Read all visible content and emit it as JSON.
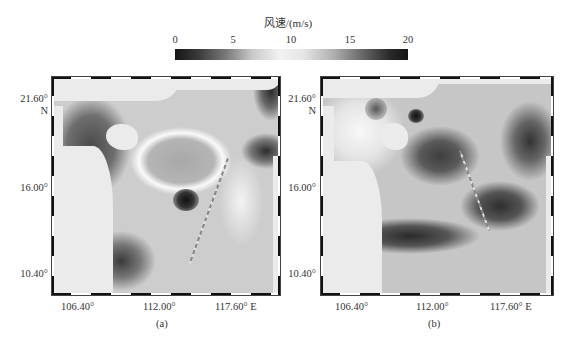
{
  "colorbar": {
    "title": "风速/(m/s)",
    "ticks": [
      "0",
      "5",
      "10",
      "15",
      "20"
    ],
    "min": 0,
    "max": 20,
    "colormap": "grayscale diverging: dark at 0 and 20, white at ~10"
  },
  "axes": {
    "y_ticks": [
      "21.60°",
      "16.00°",
      "10.40°"
    ],
    "y_unit": "N",
    "x_ticks": [
      "106.40°",
      "112.00°",
      "117.60°"
    ],
    "x_unit_suffix": "E",
    "x_last_label": "117.60° E"
  },
  "panels": [
    {
      "label": "(a)",
      "description": "Wind speed field over South China Sea with bright ring around central low-wind region, dark low-wind spot near 15°N 112.5°E, satellite track crossing diagonally"
    },
    {
      "label": "(b)",
      "description": "Wind speed field over South China Sea with dark high-wind band from south-west to east, satellite track crossing diagonally"
    }
  ],
  "colors": {
    "land": "#ebebeb",
    "frame": "#111111",
    "text": "#333333"
  }
}
